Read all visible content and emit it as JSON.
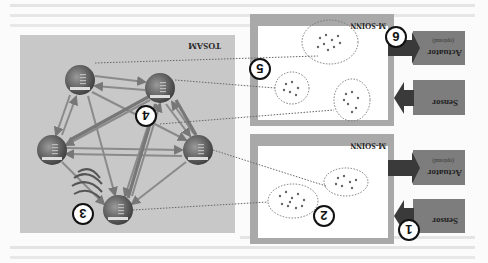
{
  "figure": {
    "orientation": "rotated-180",
    "tosam": {
      "label": "TOSAM"
    },
    "modules": [
      {
        "label": "M-SOINN",
        "sensor": {
          "label": "Sensor"
        },
        "actuator": {
          "label": "Actuator",
          "sublabel": "(optional)"
        }
      },
      {
        "label": "M-SOINN",
        "sensor": {
          "label": "Sensor"
        },
        "actuator": {
          "label": "Actuator",
          "sublabel": "(optional)"
        }
      }
    ],
    "callouts": [
      "1",
      "2",
      "3",
      "4",
      "5",
      "6"
    ],
    "colors": {
      "tosam_bg": "#c8c8c8",
      "msoinn_border": "#a9a9a9",
      "block_fill": "#7d7d7d",
      "arrow_dark": "#3a3a3a",
      "node_fill": "#6b6b6b"
    }
  }
}
